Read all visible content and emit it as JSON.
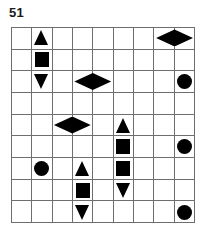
{
  "puzzle": {
    "label": "51",
    "grid": {
      "columns": 9,
      "rows": 9,
      "line_color": "#6e6e6e",
      "background": "#ffffff",
      "shape_color": "#000000"
    },
    "shapes": [
      {
        "name": "triangle-up",
        "row": 1,
        "col": 2,
        "span": 1
      },
      {
        "name": "diamond-horizontal",
        "row": 1,
        "col": 8,
        "span": 2
      },
      {
        "name": "square",
        "row": 2,
        "col": 2,
        "span": 1
      },
      {
        "name": "triangle-down",
        "row": 3,
        "col": 2,
        "span": 1
      },
      {
        "name": "diamond-horizontal",
        "row": 3,
        "col": 4,
        "span": 2
      },
      {
        "name": "circle",
        "row": 3,
        "col": 9,
        "span": 1
      },
      {
        "name": "diamond-horizontal",
        "row": 5,
        "col": 3,
        "span": 2
      },
      {
        "name": "triangle-up",
        "row": 5,
        "col": 6,
        "span": 1
      },
      {
        "name": "square",
        "row": 6,
        "col": 6,
        "span": 1
      },
      {
        "name": "circle",
        "row": 6,
        "col": 9,
        "span": 1
      },
      {
        "name": "circle",
        "row": 7,
        "col": 2,
        "span": 1
      },
      {
        "name": "triangle-up",
        "row": 7,
        "col": 4,
        "span": 1
      },
      {
        "name": "square",
        "row": 7,
        "col": 6,
        "span": 1
      },
      {
        "name": "square",
        "row": 8,
        "col": 4,
        "span": 1
      },
      {
        "name": "triangle-down",
        "row": 8,
        "col": 6,
        "span": 1
      },
      {
        "name": "triangle-down",
        "row": 9,
        "col": 4,
        "span": 1
      },
      {
        "name": "circle",
        "row": 9,
        "col": 9,
        "span": 1
      }
    ]
  }
}
